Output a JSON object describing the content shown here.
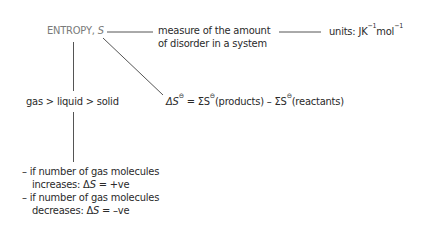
{
  "diagram": {
    "root": {
      "label": "ENTROPY, ",
      "symbol": "S"
    },
    "definition": {
      "line1": "measure of the amount",
      "line2": "of disorder in a system"
    },
    "units": {
      "prefix": "units: J",
      "k": "K",
      "k_exp": "−1",
      "mol": "mol",
      "mol_exp": "−1"
    },
    "states": {
      "ordering": "gas > liquid > solid"
    },
    "equation": {
      "delta": "ΔS",
      "standard": "⊖",
      "eq": " = ΣS",
      "products": "(products) – ΣS",
      "reactants": "(reactants)"
    },
    "rules": [
      {
        "line1": "– if number of gas molecules",
        "line2_prefix": "increases: Δ",
        "symbol": "S",
        "line2_suffix": " = +ve"
      },
      {
        "line1": "– if number of gas molecules",
        "line2_prefix": "decreases: Δ",
        "symbol": "S",
        "line2_suffix": " = –ve"
      }
    ],
    "colors": {
      "title": "#7a7a7a",
      "text": "#2a2a2a",
      "line": "#555555"
    }
  }
}
